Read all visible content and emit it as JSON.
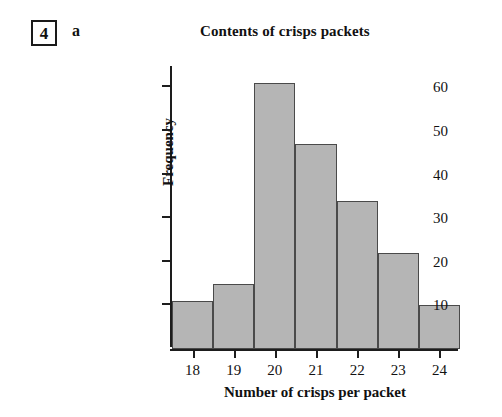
{
  "question": {
    "number": "4",
    "part": "a"
  },
  "chart_data": {
    "type": "bar",
    "title": "Contents of crisps packets",
    "xlabel": "Number of crisps per packet",
    "ylabel": "Frequency",
    "categories": [
      "18",
      "19",
      "20",
      "21",
      "22",
      "23",
      "24"
    ],
    "values": [
      11,
      15,
      61,
      47,
      34,
      22,
      10
    ],
    "bin_edges": [
      17.5,
      18.5,
      19.5,
      20.5,
      21.5,
      22.5,
      23.5,
      24.5
    ],
    "xtick_labels": [
      "18",
      "19",
      "20",
      "21",
      "22",
      "23",
      "24"
    ],
    "ytick_labels": [
      "10",
      "20",
      "30",
      "40",
      "50",
      "60"
    ],
    "ytick_values": [
      10,
      20,
      30,
      40,
      50,
      60
    ],
    "xlim": [
      17.5,
      24.5
    ],
    "ylim": [
      0,
      64
    ],
    "grid": false,
    "legend": false,
    "bar_fill_color": "#b5b5b5",
    "bar_border_color": "#4a4a4a",
    "axis_color": "#1d1d1d"
  }
}
